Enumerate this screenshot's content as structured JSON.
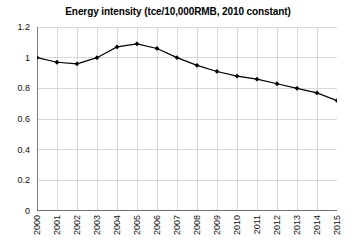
{
  "chart_data": {
    "type": "line",
    "title": "Energy intensity (tce/10,000RMB, 2010 constant)",
    "xlabel": "",
    "ylabel": "",
    "categories": [
      "2000",
      "2001",
      "2002",
      "2003",
      "2004",
      "2005",
      "2006",
      "2007",
      "2008",
      "2009",
      "2010",
      "2011",
      "2012",
      "2013",
      "2014",
      "2015"
    ],
    "values": [
      1.0,
      0.97,
      0.96,
      1.0,
      1.07,
      1.09,
      1.06,
      1.0,
      0.95,
      0.91,
      0.88,
      0.86,
      0.83,
      0.8,
      0.77,
      0.72
    ],
    "ylim": [
      0,
      1.2
    ],
    "yticks": [
      "0",
      "0.2",
      "0.4",
      "0.6",
      "0.8",
      "1",
      "1.2"
    ],
    "ytick_values": [
      0,
      0.2,
      0.4,
      0.6,
      0.8,
      1.0,
      1.2
    ],
    "grid": true,
    "legend": "none",
    "series_color": "#000000",
    "grid_color": "#c8c8d2",
    "axis_color": "#808080",
    "marker": "diamond"
  }
}
